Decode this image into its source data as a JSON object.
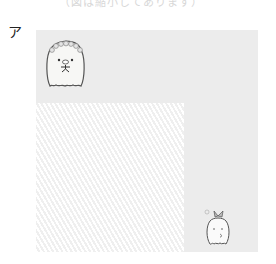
{
  "caption": {
    "top_text": "（図は縮小してあります）"
  },
  "figure": {
    "label": "ア",
    "panel_color": "#ececec",
    "hatch_color": "#f4f4f4"
  },
  "characters": [
    {
      "name": "penguin-with-flower-crown",
      "position": "top-left"
    },
    {
      "name": "white-creature-with-bow",
      "position": "bottom-right"
    }
  ]
}
